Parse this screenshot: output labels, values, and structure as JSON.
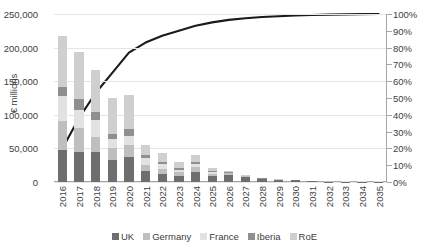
{
  "chart_data": {
    "type": "bar",
    "title": "",
    "xlabel": "",
    "ylabel": "€ millions",
    "ylabel_right": "",
    "ylim": [
      0,
      250000
    ],
    "ylim_right": [
      0,
      100
    ],
    "grid": true,
    "legend_position": "bottom",
    "categories": [
      "2016",
      "2017",
      "2018",
      "2019",
      "2020",
      "2021",
      "2022",
      "2023",
      "2024",
      "2025",
      "2026",
      "2027",
      "2028",
      "2029",
      "2030",
      "2031",
      "2032",
      "2033",
      "2034",
      "2035"
    ],
    "ytick_labels": [
      "250,000",
      "200,000",
      "150,000",
      "100,000",
      "50,000",
      "0"
    ],
    "ytick_values": [
      250000,
      200000,
      150000,
      100000,
      50000,
      0
    ],
    "ytick_right_labels": [
      "100%",
      "90%",
      "80%",
      "70%",
      "60%",
      "50%",
      "40%",
      "30%",
      "20%",
      "10%",
      "0%"
    ],
    "ytick_right_values": [
      100,
      90,
      80,
      70,
      60,
      50,
      40,
      30,
      20,
      10,
      0
    ],
    "series": [
      {
        "name": "UK",
        "color": "#6e6e6e",
        "values": [
          48000,
          45000,
          45000,
          33000,
          37000,
          17000,
          12000,
          9000,
          15000,
          9000,
          11000,
          7500,
          4000,
          2800,
          2600,
          900,
          700,
          600,
          600,
          600
        ]
      },
      {
        "name": "Germany",
        "color": "#bfbfbf",
        "values": [
          43000,
          35000,
          22000,
          18000,
          18000,
          9000,
          8000,
          5500,
          7000,
          3500,
          2000,
          1000,
          700,
          400,
          300,
          200,
          150,
          150,
          150,
          150
        ]
      },
      {
        "name": "France",
        "color": "#e2e2e2",
        "values": [
          37000,
          27000,
          26000,
          13000,
          13000,
          9000,
          7000,
          4000,
          5000,
          2500,
          800,
          500,
          400,
          300,
          200,
          150,
          120,
          120,
          120,
          120
        ]
      },
      {
        "name": "Iberia",
        "color": "#8f8f8f",
        "values": [
          13000,
          16000,
          11000,
          8000,
          11000,
          5000,
          3500,
          2500,
          2800,
          1500,
          500,
          400,
          300,
          200,
          150,
          100,
          100,
          100,
          100,
          100
        ]
      },
      {
        "name": "RoE",
        "color": "#cfcfcf",
        "values": [
          77000,
          70000,
          63000,
          53000,
          51000,
          15000,
          13000,
          9000,
          11000,
          4500,
          1500,
          900,
          700,
          500,
          300,
          200,
          180,
          180,
          180,
          180
        ]
      }
    ],
    "line_series": {
      "name": "Cumulative %",
      "color": "#1a1a1a",
      "values": [
        20,
        38,
        53,
        65,
        77,
        83,
        87,
        90,
        93,
        95,
        96.5,
        97.5,
        98.2,
        98.7,
        99.1,
        99.4,
        99.6,
        99.8,
        99.9,
        100
      ]
    },
    "legend": [
      "UK",
      "Germany",
      "France",
      "Iberia",
      "RoE"
    ]
  }
}
